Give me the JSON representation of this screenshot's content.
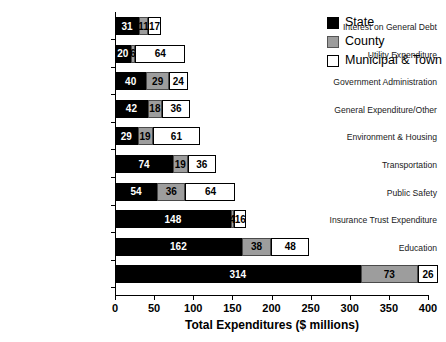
{
  "chart_data": {
    "type": "bar",
    "orientation": "horizontal",
    "stacked": true,
    "title": "",
    "xlabel": "Total Expenditures ($ millions)",
    "ylabel": "",
    "xlim": [
      0,
      400
    ],
    "xticks": [
      0,
      50,
      100,
      150,
      200,
      250,
      300,
      350,
      400
    ],
    "grid": false,
    "legend_position": "top-right",
    "categories": [
      "Interest on General Debt",
      "Utility Expenditure",
      "Government Administration",
      "General Expenditure/Other",
      "Environment & Housing",
      "Transportation",
      "Public Safety",
      "Insurance Trust Expenditure",
      "Education",
      "Social Services"
    ],
    "series": [
      {
        "name": "State",
        "color": "#000000",
        "values": [
          31,
          20,
          40,
          42,
          29,
          74,
          54,
          148,
          162,
          314
        ]
      },
      {
        "name": "County",
        "color": "#9d9d9d",
        "values": [
          11,
          6,
          29,
          18,
          19,
          19,
          36,
          4,
          38,
          73
        ]
      },
      {
        "name": "Municipal & Town",
        "color": "#ffffff",
        "values": [
          17,
          64,
          24,
          36,
          61,
          36,
          64,
          16,
          48,
          26
        ]
      }
    ]
  },
  "legend": {
    "items": [
      {
        "label": "State"
      },
      {
        "label": "County"
      },
      {
        "label": "Municipal & Town"
      }
    ]
  },
  "axis": {
    "x_title": "Total Expenditures ($ millions)",
    "x_tick_labels": [
      "0",
      "50",
      "100",
      "150",
      "200",
      "250",
      "300",
      "350",
      "400"
    ]
  }
}
